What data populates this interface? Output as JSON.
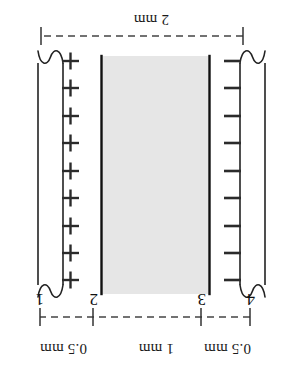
{
  "figure": {
    "orientation": "rotated-180",
    "background_color": "#ffffff",
    "line_color": "#111111",
    "gap_fill_color": "#e6e6e6"
  },
  "dimensions": {
    "top_left_gap_label": "0.5 mm",
    "top_middle_gap_label": "1 mm",
    "top_right_gap_label": "0.5 mm",
    "bottom_total_label": "2 mm"
  },
  "markers": {
    "label_1": "1",
    "label_2": "2",
    "label_3": "3",
    "label_4": "4"
  },
  "electrodes": {
    "positive": {
      "polarity_symbol": "+",
      "charge_count": 9,
      "side": "right"
    },
    "negative": {
      "polarity_symbol": "–",
      "charge_count": 9,
      "side": "left"
    }
  }
}
